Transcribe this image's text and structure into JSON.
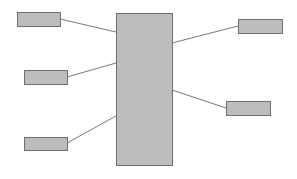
{
  "diagram": {
    "colors": {
      "fill": "#bdbdbd",
      "stroke": "#6e6e6e",
      "line": "#7a7a7a",
      "background": "#ffffff"
    },
    "center_block": {
      "x": 116,
      "y": 13,
      "w": 56,
      "h": 152
    },
    "boxes": [
      {
        "id": "left-top",
        "x": 17,
        "y": 12,
        "w": 43,
        "h": 14
      },
      {
        "id": "left-middle",
        "x": 24,
        "y": 70,
        "w": 43,
        "h": 14
      },
      {
        "id": "left-bottom",
        "x": 24,
        "y": 137,
        "w": 43,
        "h": 13
      },
      {
        "id": "right-top",
        "x": 238,
        "y": 19,
        "w": 44,
        "h": 14
      },
      {
        "id": "right-bottom",
        "x": 226,
        "y": 101,
        "w": 44,
        "h": 14
      }
    ],
    "connectors": [
      {
        "from": "left-top",
        "x1": 60,
        "y1": 19,
        "x2": 116,
        "y2": 32
      },
      {
        "from": "left-middle",
        "x1": 67,
        "y1": 77,
        "x2": 116,
        "y2": 63
      },
      {
        "from": "left-bottom",
        "x1": 67,
        "y1": 143,
        "x2": 116,
        "y2": 116
      },
      {
        "from": "right-top",
        "x1": 172,
        "y1": 43,
        "x2": 238,
        "y2": 26
      },
      {
        "from": "right-bottom",
        "x1": 172,
        "y1": 90,
        "x2": 226,
        "y2": 108
      }
    ]
  }
}
